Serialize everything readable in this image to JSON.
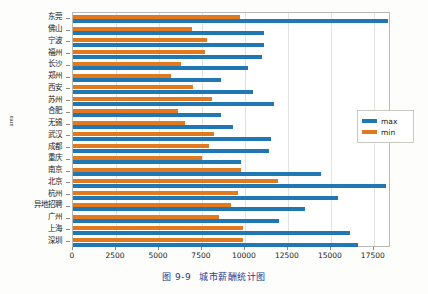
{
  "caption": {
    "number": "图 9-9",
    "title": "城市薪酬统计图"
  },
  "axes": {
    "ylabel": "area",
    "xlabel": "",
    "xticks": [
      "0",
      "2500",
      "5000",
      "7500",
      "10000",
      "12500",
      "15000",
      "17500"
    ],
    "xlim": [
      0,
      18500
    ],
    "grid": "vertical"
  },
  "legend": {
    "position": "center-right",
    "entries": [
      {
        "label": "max",
        "color": "#1f77b4"
      },
      {
        "label": "min",
        "color": "#e3791f"
      }
    ]
  },
  "colors": {
    "max": "#1f77b4",
    "min": "#e3791f",
    "caption": "#1b3a8f",
    "grid": "#e2e2de",
    "frame": "#b9b9b4"
  },
  "chart_data": {
    "type": "bar",
    "orientation": "horizontal",
    "title": "城市薪酬统计图",
    "xlabel": "",
    "ylabel": "area",
    "xlim": [
      0,
      18500
    ],
    "grid": true,
    "legend_position": "center-right",
    "categories": [
      "东莞",
      "佛山",
      "宁波",
      "福州",
      "长沙",
      "郑州",
      "西安",
      "苏州",
      "合肥",
      "无锡",
      "武汉",
      "成都",
      "重庆",
      "南京",
      "北京",
      "杭州",
      "异地招聘",
      "广州",
      "上海",
      "深圳"
    ],
    "series": [
      {
        "name": "max",
        "color": "#1f77b4",
        "values": [
          18300,
          11100,
          11100,
          11000,
          10200,
          8600,
          10500,
          11700,
          8600,
          9300,
          11500,
          11400,
          9800,
          14400,
          18200,
          15400,
          13500,
          12000,
          16100,
          16600
        ]
      },
      {
        "name": "min",
        "color": "#e3791f",
        "values": [
          9700,
          6900,
          7800,
          7700,
          6300,
          5700,
          7000,
          8100,
          6100,
          6500,
          8200,
          7900,
          7500,
          9800,
          11900,
          9600,
          9200,
          8500,
          9900,
          9900
        ]
      }
    ]
  }
}
